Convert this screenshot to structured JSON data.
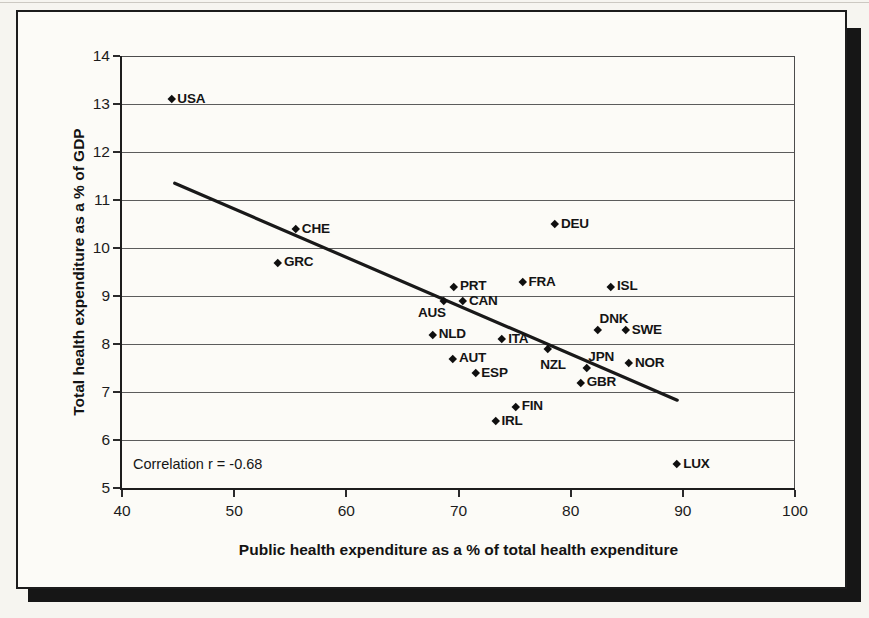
{
  "chart_data": {
    "type": "scatter",
    "title": "",
    "xlabel": "Public health expenditure as a % of total health expenditure",
    "ylabel": "Total health expenditure as a % of GDP",
    "xlim": [
      40,
      100
    ],
    "ylim": [
      5,
      14
    ],
    "xticks": [
      40,
      50,
      60,
      70,
      80,
      90,
      100
    ],
    "yticks": [
      5,
      6,
      7,
      8,
      9,
      10,
      11,
      12,
      13,
      14
    ],
    "grid": "horizontal",
    "marker": "diamond",
    "legend": "none",
    "annotation": "Correlation r = -0.68",
    "correlation_r": -0.68,
    "points": [
      {
        "label": "USA",
        "x": 44.4,
        "y": 13.1,
        "label_side": "right"
      },
      {
        "label": "CHE",
        "x": 55.5,
        "y": 10.4,
        "label_side": "right"
      },
      {
        "label": "GRC",
        "x": 53.9,
        "y": 9.7,
        "label_side": "right"
      },
      {
        "label": "DEU",
        "x": 78.6,
        "y": 10.5,
        "label_side": "right"
      },
      {
        "label": "PRT",
        "x": 69.6,
        "y": 9.2,
        "label_side": "right"
      },
      {
        "label": "FRA",
        "x": 75.7,
        "y": 9.3,
        "label_side": "right"
      },
      {
        "label": "ISL",
        "x": 83.6,
        "y": 9.2,
        "label_side": "right"
      },
      {
        "label": "AUS",
        "x": 68.7,
        "y": 8.9,
        "label_side": "left"
      },
      {
        "label": "CAN",
        "x": 70.4,
        "y": 8.9,
        "label_side": "right"
      },
      {
        "label": "DNK",
        "x": 82.4,
        "y": 8.3,
        "label_side": "above"
      },
      {
        "label": "SWE",
        "x": 84.9,
        "y": 8.3,
        "label_side": "right"
      },
      {
        "label": "NLD",
        "x": 67.7,
        "y": 8.2,
        "label_side": "right"
      },
      {
        "label": "ITA",
        "x": 73.9,
        "y": 8.1,
        "label_side": "right"
      },
      {
        "label": "NZL",
        "x": 78.0,
        "y": 7.9,
        "label_side": "below"
      },
      {
        "label": "AUT",
        "x": 69.5,
        "y": 7.7,
        "label_side": "right"
      },
      {
        "label": "NOR",
        "x": 85.2,
        "y": 7.6,
        "label_side": "right"
      },
      {
        "label": "JPN",
        "x": 81.4,
        "y": 7.5,
        "label_side": "above"
      },
      {
        "label": "ESP",
        "x": 71.5,
        "y": 7.4,
        "label_side": "right"
      },
      {
        "label": "GBR",
        "x": 80.9,
        "y": 7.2,
        "label_side": "right"
      },
      {
        "label": "FIN",
        "x": 75.1,
        "y": 6.7,
        "label_side": "right"
      },
      {
        "label": "IRL",
        "x": 73.3,
        "y": 6.4,
        "label_side": "right"
      },
      {
        "label": "LUX",
        "x": 89.5,
        "y": 5.5,
        "label_side": "right"
      }
    ],
    "trendline": {
      "x1": 44.7,
      "y1": 11.35,
      "x2": 89.5,
      "y2": 6.83
    },
    "colors": {
      "marker": "#0f0f0f",
      "trendline": "#191919",
      "gridline": "#5c5c5c",
      "paper": "#fcfbf7"
    }
  }
}
